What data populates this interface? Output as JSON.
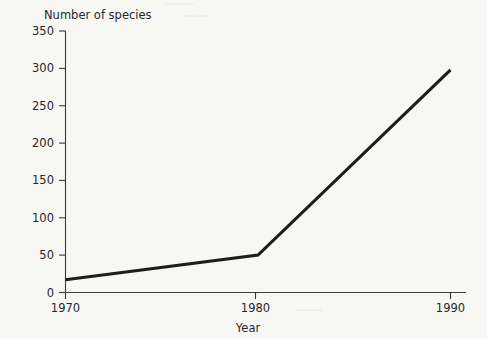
{
  "chart_data": {
    "type": "line",
    "title": "",
    "xlabel": "Year",
    "ylabel": "Number of species",
    "x": [
      1970,
      1980,
      1990
    ],
    "values": [
      17,
      50,
      298
    ],
    "series": [
      {
        "name": "Number of species",
        "values": [
          17,
          50,
          298
        ]
      }
    ],
    "xlim": [
      1966,
      1993
    ],
    "ylim": [
      0,
      350
    ],
    "xticks": [
      1970,
      1980,
      1990
    ],
    "xtick_labels": [
      "1970",
      "1980",
      "1990"
    ],
    "yticks": [
      0,
      50,
      100,
      150,
      200,
      250,
      300,
      350
    ],
    "ytick_labels": [
      "0",
      "50",
      "100",
      "150",
      "200",
      "250",
      "300",
      "350"
    ],
    "grid": false,
    "legend": false,
    "legend_position": "none",
    "line_color": "#1d1d1b",
    "axis_color": "#3a3a38",
    "background_color": "#f7f7f3"
  },
  "figure": {
    "y_axis_title": "Number of species",
    "x_axis_title": "Year"
  },
  "artifacts": {
    "bleed_rows": [
      "́́ ́́́́ ́́́ ́́́́ ́́ ́́́́́ ́́́́́́ ́́́ ́́́́́",
      "́́́́́ ́́́ ́́́́́́ ́́́́ ́́́ ́́́́́ ́́ ́́́́́́́",
      "́́́ ́́́́́ ́́́́ ́́́ ́́́́́́ ́́́́ ́́́ ́́́́"
    ]
  }
}
